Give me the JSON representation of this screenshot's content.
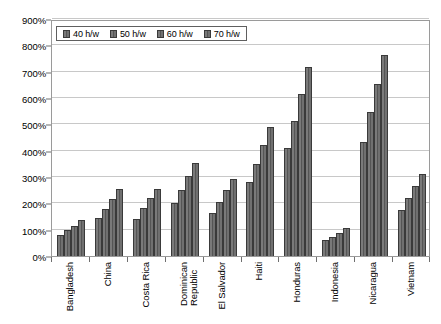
{
  "chart_data": {
    "type": "bar",
    "title": "",
    "xlabel": "",
    "ylabel": "",
    "ylim": [
      0,
      900
    ],
    "y_tick_labels": [
      "0%",
      "100%",
      "200%",
      "300%",
      "400%",
      "500%",
      "600%",
      "700%",
      "800%",
      "900%"
    ],
    "y_tick_values": [
      0,
      100,
      200,
      300,
      400,
      500,
      600,
      700,
      800,
      900
    ],
    "grid": true,
    "legend_position": "top-left-inside",
    "categories": [
      "Bangladesh",
      "China",
      "Costa Rica",
      "Dominican Republic",
      "El Salvador",
      "Haiti",
      "Honduras",
      "Indonesia",
      "Nicaragua",
      "Vietnam"
    ],
    "series": [
      {
        "name": "40 h/w",
        "values": [
          78,
          143,
          142,
          200,
          165,
          282,
          409,
          60,
          433,
          176
        ]
      },
      {
        "name": "50 h/w",
        "values": [
          98,
          180,
          181,
          252,
          207,
          350,
          512,
          74,
          545,
          221
        ]
      },
      {
        "name": "60 h/w",
        "values": [
          115,
          218,
          219,
          302,
          250,
          420,
          617,
          89,
          655,
          267
        ]
      },
      {
        "name": "70 h/w",
        "values": [
          135,
          255,
          255,
          352,
          292,
          491,
          718,
          105,
          765,
          311
        ]
      }
    ],
    "colors": {
      "bar_fill": "#6b6b6b",
      "bar_stroke": "#3a3a3a",
      "gridline": "#c8c8c8",
      "axis": "#808080",
      "plot_border": "#9a9a9a",
      "text": "#000000"
    }
  }
}
